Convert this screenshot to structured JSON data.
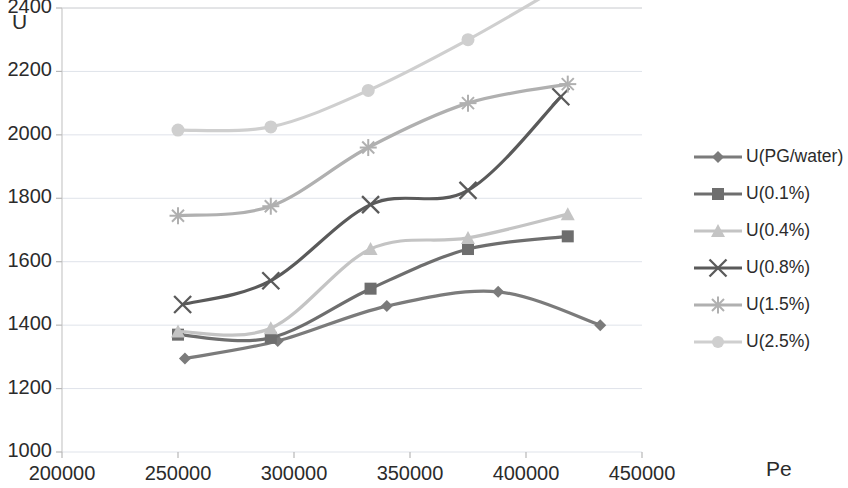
{
  "chart_data": {
    "type": "line",
    "title": "",
    "xlabel": "Pe",
    "ylabel": "U",
    "xlim": [
      200000,
      450000
    ],
    "ylim": [
      1000,
      2400
    ],
    "xticks": [
      "200000",
      "250000",
      "300000",
      "350000",
      "400000",
      "450000"
    ],
    "yticks": [
      "1000",
      "1200",
      "1400",
      "1600",
      "1800",
      "2000",
      "2200",
      "2400"
    ],
    "grid": true,
    "legend_position": "right",
    "series": [
      {
        "name": "U(PG/water)",
        "marker": "diamond",
        "color": "#7b7b7b",
        "x": [
          253000,
          293000,
          340000,
          388000,
          432000
        ],
        "values": [
          1295,
          1350,
          1460,
          1505,
          1400
        ]
      },
      {
        "name": "U(0.1%)",
        "marker": "square",
        "color": "#6e6e6e",
        "x": [
          250000,
          290000,
          333000,
          375000,
          418000
        ],
        "values": [
          1370,
          1360,
          1515,
          1640,
          1680
        ]
      },
      {
        "name": "U(0.4%)",
        "marker": "triangle",
        "color": "#c4c4c4",
        "x": [
          250000,
          290000,
          333000,
          375000,
          418000
        ],
        "values": [
          1380,
          1390,
          1640,
          1675,
          1750
        ]
      },
      {
        "name": "U(0.8%)",
        "marker": "cross",
        "color": "#5a5a5a",
        "x": [
          252000,
          290000,
          333000,
          375000,
          415000
        ],
        "values": [
          1465,
          1540,
          1780,
          1825,
          2120
        ]
      },
      {
        "name": "U(1.5%)",
        "marker": "star",
        "color": "#b0b0b0",
        "x": [
          250000,
          290000,
          332000,
          375000,
          418000
        ],
        "values": [
          1745,
          1775,
          1960,
          2100,
          2160
        ]
      },
      {
        "name": "U(2.5%)",
        "marker": "circle",
        "color": "#cfcfcf",
        "x": [
          250000,
          290000,
          332000,
          375000,
          413000
        ],
        "values": [
          2015,
          2025,
          2140,
          2300,
          2460
        ]
      }
    ]
  },
  "legend": {
    "items": [
      {
        "label": "U(PG/water)"
      },
      {
        "label": "U(0.1%)"
      },
      {
        "label": "U(0.4%)"
      },
      {
        "label": "U(0.8%)"
      },
      {
        "label": "U(1.5%)"
      },
      {
        "label": "U(2.5%)"
      }
    ]
  }
}
